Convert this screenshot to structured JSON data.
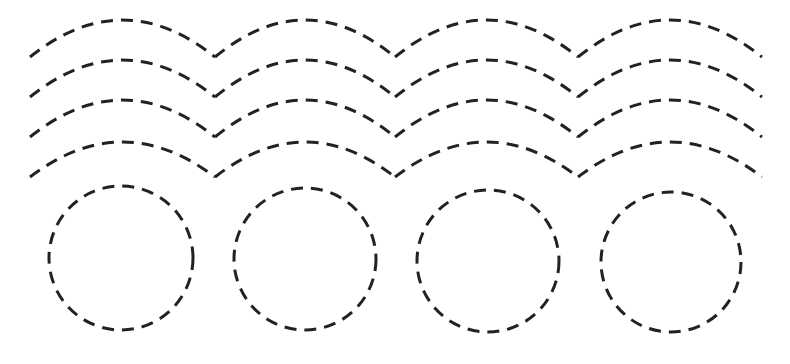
{
  "worksheet": {
    "background": "#ffffff",
    "stroke_color": "#222222",
    "stroke_width": 3,
    "dash_pattern": "12 8",
    "arch_rows": [
      {
        "end_y": 57,
        "peak_y": 20,
        "xs": [
          30,
          215,
          395,
          578,
          762
        ]
      },
      {
        "end_y": 97,
        "peak_y": 60,
        "xs": [
          30,
          215,
          395,
          578,
          762
        ]
      },
      {
        "end_y": 137,
        "peak_y": 100,
        "xs": [
          30,
          215,
          395,
          578,
          762
        ]
      },
      {
        "end_y": 177,
        "peak_y": 142,
        "xs": [
          30,
          215,
          395,
          578,
          762
        ]
      }
    ],
    "circles": [
      {
        "cx": 121,
        "cy": 258,
        "r": 72
      },
      {
        "cx": 305,
        "cy": 259,
        "r": 71
      },
      {
        "cx": 488,
        "cy": 261,
        "r": 71
      },
      {
        "cx": 671,
        "cy": 262,
        "r": 70
      }
    ]
  }
}
